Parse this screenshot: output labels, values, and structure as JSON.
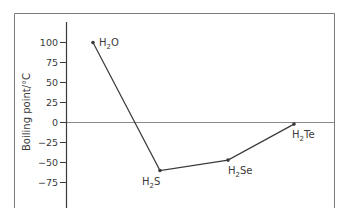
{
  "chart_data": {
    "type": "line",
    "title": "",
    "xlabel": "",
    "ylabel": "Boiling point/°C",
    "ylim": [
      -90,
      125
    ],
    "yticks": [
      100,
      75,
      50,
      25,
      0,
      -25,
      -50,
      -75
    ],
    "grid": false,
    "zero_line": true,
    "categories": [
      "H2O",
      "H2S",
      "H2Se",
      "H2Te"
    ],
    "series": [
      {
        "name": "Boiling point",
        "values": [
          100,
          -60,
          -47,
          -2
        ]
      }
    ],
    "point_labels": [
      {
        "base": "H",
        "sub": "2",
        "rest": "O"
      },
      {
        "base": "H",
        "sub": "2",
        "rest": "S"
      },
      {
        "base": "H",
        "sub": "2",
        "rest": "Se"
      },
      {
        "base": "H",
        "sub": "2",
        "rest": "Te"
      }
    ],
    "colors": {
      "line": "#3a3a3a",
      "axis": "#3a3a3a",
      "frame": "#7a7a7a",
      "zero_line": "#8a8a8a"
    }
  }
}
